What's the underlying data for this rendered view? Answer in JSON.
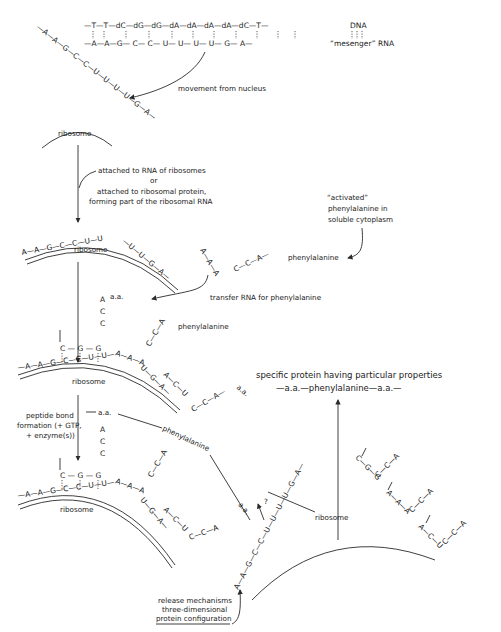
{
  "diagram": {
    "dna_strand": [
      "T",
      "T",
      "dC",
      "dG",
      "dG",
      "dA",
      "dA",
      "dA",
      "dA",
      "dC",
      "T"
    ],
    "mrna_strand": [
      "A",
      "A",
      "G",
      "C",
      "C",
      "U",
      "U",
      "U",
      "U",
      "G",
      "A"
    ],
    "legend": {
      "dna": "DNA",
      "mrna": "“mesenger” RNA"
    },
    "labels": {
      "movement": "movement from nucleus",
      "ribosome": "ribosome",
      "attached_1": "attached to RNA of ribosomes",
      "attached_or": "or",
      "attached_2": "attached to ribosomal protein,",
      "attached_3": "forming part of the ribosomal RNA",
      "activated_1": "“activated”",
      "activated_2": "phenylalanine in",
      "activated_3": "soluble cytoplasm",
      "phenylalanine": "phenylalanine",
      "trna": "transfer RNA for phenylalanine",
      "aa": "a.a.",
      "peptide_1": "peptide bond",
      "peptide_2": "formation (+ GTP,",
      "peptide_3": "+ enzyme(s))",
      "protein_1": "specific protein having particular properties",
      "protein_2": "—a.a.—phenylalanine—a.a.—",
      "release_1": "release mechanisms",
      "release_2": "three-dimensional",
      "release_3": "protein configuration",
      "question": "?"
    },
    "trna_anticodon": [
      "A",
      "A",
      "A"
    ],
    "trna_tail": [
      "C",
      "C",
      "A"
    ],
    "diag_mrna": [
      "A",
      "A",
      "G",
      "C",
      "C",
      "U",
      "U",
      "U",
      "U",
      "G",
      "A"
    ]
  }
}
